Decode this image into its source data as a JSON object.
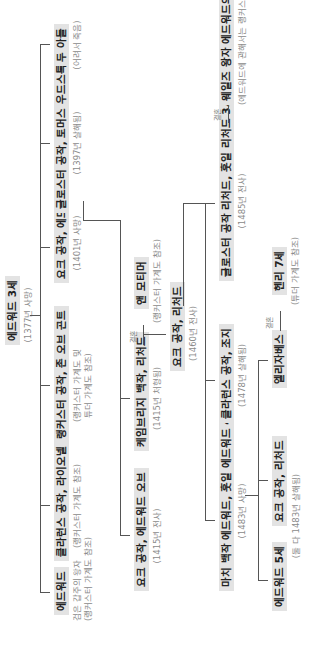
{
  "diagram": {
    "type": "family-tree",
    "orientation": "rotated-90-ccw",
    "root": {
      "name": "에드워드 3세",
      "note": "(1377년 사망)"
    },
    "generation1": [
      {
        "name": "에드워드",
        "note1": "검은 갑주의 왕자",
        "note2": "(랭커스터 가계도 참조)"
      },
      {
        "name": "클라런스 공작, 라이오넬",
        "note": "(랭커스터 가계도 참조)"
      },
      {
        "name": "랭커스터 공작, 존 오브 곤트",
        "note1": "(랭커스터 가계도 및",
        "note2": "튜더 가계도 참조)"
      },
      {
        "name": "요크 공작, 에드먼드",
        "note": "(1401년 사망)"
      },
      {
        "name": "글로스터 공작, 토머스 우드스톡",
        "note": "(1397년 살해됨)"
      },
      {
        "name": "두 아들",
        "note": "(어려서 죽음)"
      }
    ],
    "generation2": [
      {
        "name": "요크 공작, 에드워드 오브",
        "note": "(1415년 전사)"
      },
      {
        "name": "케임브리지 백작, 리처드",
        "note": "(1415년 처형됨)"
      },
      {
        "name": "앤 모티머",
        "note": "(랭커스터 가계도 참조)"
      }
    ],
    "marriage_label": "결혼",
    "generation3": {
      "name": "요크 공작, 리처드",
      "note": "(1460년 전사)"
    },
    "generation4": [
      {
        "name": "마치 백작 에드워드, 훗일 에드워드 4세",
        "note": "(1483년 사망)"
      },
      {
        "name": "클라런스 공작, 조지",
        "note": "(1478년 살해됨)"
      },
      {
        "name": "글로스터 공작 리처드, 훗일 리처드 3세",
        "note": "(1485년 전사)"
      },
      {
        "name": "웨일즈 왕자 에드워드의 미망인 앤",
        "note": "(에드워드에 관해서는 랭커스터 가계도 참조)"
      }
    ],
    "generation5": [
      {
        "name": "에드워드 5세",
        "note": "(둘 다 1483년 살해됨)"
      },
      {
        "name": "요크 공작, 리처드"
      },
      {
        "name": "엘리자베스"
      },
      {
        "name": "헨리 7세",
        "note": "(튜더 가계도 참조)"
      }
    ]
  }
}
